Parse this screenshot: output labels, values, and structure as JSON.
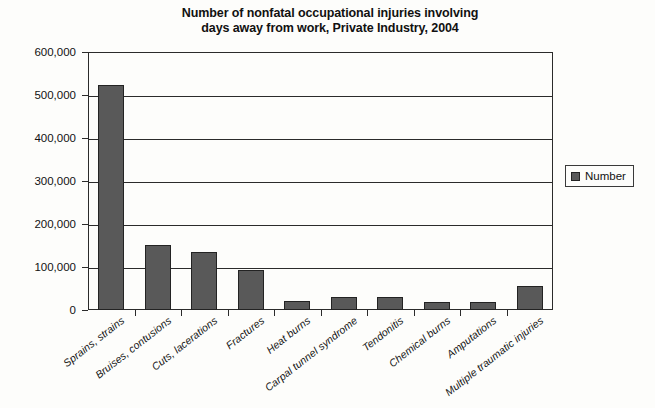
{
  "chart_data": {
    "type": "bar",
    "title": "Number of nonfatal occupational injuries involving days away from work, Private Industry, 2004",
    "title_line1": "Number of nonfatal occupational injuries involving",
    "title_line2": "days away from work, Private Industry, 2004",
    "xlabel": "",
    "ylabel": "",
    "ylim": [
      0,
      600000
    ],
    "ytick_labels": [
      "600,000",
      "500,000",
      "400,000",
      "300,000",
      "200,000",
      "100,000",
      "0"
    ],
    "ytick_values": [
      600000,
      500000,
      400000,
      300000,
      200000,
      100000,
      0
    ],
    "grid": true,
    "grid_axis": "y",
    "legend": {
      "position": "right",
      "entries": [
        {
          "label": "Number",
          "color": "#595959"
        }
      ]
    },
    "categories": [
      "Sprains, strains",
      "Bruises, contusions",
      "Cuts, lacerations",
      "Fractures",
      "Heat burns",
      "Carpal tunnel syndrome",
      "Tendonitis",
      "Chemical burns",
      "Amputations",
      "Multiple traumatic injuries"
    ],
    "series": [
      {
        "name": "Number",
        "color": "#595959",
        "values": [
          523000,
          152000,
          135000,
          93000,
          20000,
          30000,
          30000,
          18000,
          19000,
          57000
        ]
      }
    ],
    "bar_color": "#595959",
    "bar_edge_color": "#232323",
    "axis_color": "#2b2b2b"
  }
}
